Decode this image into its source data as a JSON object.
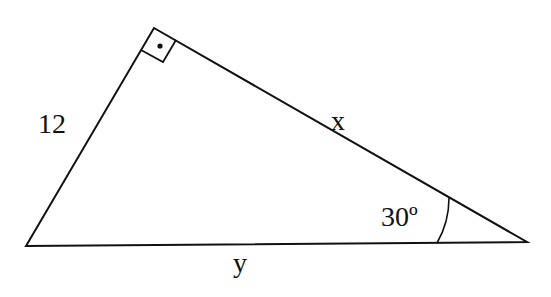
{
  "diagram": {
    "type": "right-triangle",
    "vertices": {
      "left": [
        26,
        246
      ],
      "top": [
        154,
        28
      ],
      "right": [
        527,
        242
      ]
    },
    "right_angle_vertex": "top",
    "labels": {
      "left_side": "12",
      "hypotenuse_top_side": "x",
      "bottom_side": "y",
      "angle_right": "30º"
    },
    "colors": {
      "stroke": "#111111",
      "background": "#ffffff"
    }
  }
}
